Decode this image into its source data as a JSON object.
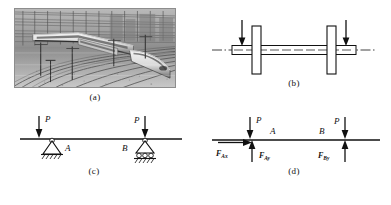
{
  "figure": {
    "panels": [
      {
        "id": "a",
        "caption": "(a)",
        "kind": "photograph",
        "subject": "high-speed train on railway tracks",
        "palette": "grayscale"
      },
      {
        "id": "b",
        "caption": "(b)",
        "kind": "axle-schematic",
        "centerline_style": "dash-dot",
        "wheels": 2,
        "load_arrows": 2,
        "arrow_direction": "down"
      },
      {
        "id": "c",
        "caption": "(c)",
        "kind": "beam-with-supports",
        "loads": [
          {
            "label": "P",
            "position": "left"
          },
          {
            "label": "P",
            "position": "right"
          }
        ],
        "supports": [
          {
            "label": "A",
            "type": "pin",
            "position": "left"
          },
          {
            "label": "B",
            "type": "roller",
            "position": "right"
          }
        ]
      },
      {
        "id": "d",
        "caption": "(d)",
        "kind": "free-body-diagram",
        "points": [
          {
            "label": "A",
            "position": "left"
          },
          {
            "label": "B",
            "position": "right"
          }
        ],
        "loads": [
          {
            "label": "P",
            "position": "left",
            "direction": "down"
          },
          {
            "label": "P",
            "position": "right",
            "direction": "down"
          }
        ],
        "reactions": [
          {
            "symbol": "F",
            "subscript": "Ax",
            "direction": "right"
          },
          {
            "symbol": "F",
            "subscript": "Ay",
            "direction": "up"
          },
          {
            "symbol": "F",
            "subscript": "By",
            "direction": "up"
          }
        ]
      }
    ]
  },
  "colors": {
    "stroke": "#111111",
    "background": "#ffffff",
    "photo_border": "#8d8d8d"
  }
}
